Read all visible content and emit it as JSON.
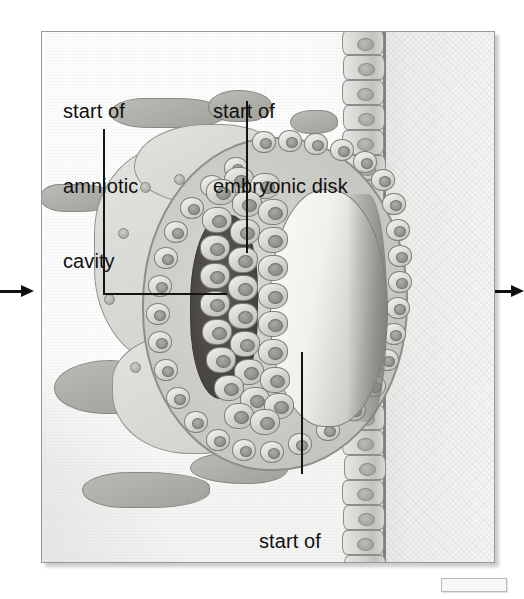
{
  "figure": {
    "background_color": "#ffffff",
    "panel": {
      "background_color": "#ececeb",
      "border_color": "#9a9a98",
      "x": 41,
      "y": 31,
      "width": 452,
      "height": 530
    }
  },
  "labels": [
    {
      "id": "amniotic-cavity",
      "line1": "start of",
      "line2": "amniotic",
      "line3": "cavity",
      "text": "start of amniotic cavity",
      "x": 62,
      "y": 48,
      "leader": {
        "type": "elbow",
        "from_x": 103,
        "from_y": 128,
        "corner_y": 293,
        "to_x": 226
      }
    },
    {
      "id": "embryonic-disk",
      "line1": "start of",
      "line2": "embryonic disk",
      "text": "start of embryonic disk",
      "x": 212,
      "y": 48,
      "leader": {
        "type": "vertical",
        "x": 246,
        "from_y": 100,
        "to_y": 252
      }
    },
    {
      "id": "yolk-sac",
      "line1": "start of",
      "line2": "yolk sac",
      "text": "start of yolk sac",
      "x": 258,
      "y": 478,
      "leader": {
        "type": "vertical",
        "x": 301,
        "from_y": 351,
        "to_y": 473
      }
    }
  ],
  "arrows": [
    {
      "id": "left-arrow",
      "direction": "right",
      "x": 0,
      "y": 285,
      "length": 34
    },
    {
      "id": "right-arrow",
      "direction": "right",
      "x": 495,
      "y": 285,
      "length": 29
    }
  ],
  "structures": [
    {
      "name": "amniotic-cavity",
      "description": "dark cavity, dorsal side of embryonic disk",
      "color": "#4a4743"
    },
    {
      "name": "embryonic-disk",
      "description": "bilaminar disk of columnar cells",
      "color": "#d2d2cc"
    },
    {
      "name": "yolk-sac",
      "description": "light cavity, ventral side of embryonic disk",
      "color": "#f0f0ed"
    },
    {
      "name": "trophoblast",
      "description": "surrounding cell mass with lacunae",
      "color": "#d9d9d4"
    },
    {
      "name": "maternal-lacunae",
      "description": "gray blood-filled spaces in endometrium",
      "color": "#a9a9a3"
    },
    {
      "name": "uterine-epithelium",
      "description": "columnar epithelium column at right",
      "color": "#d2d2ce"
    },
    {
      "name": "uterine-lumen",
      "description": "pale region right of epithelium",
      "color": "#f4f4f2"
    }
  ],
  "scale_box": {
    "id": "scale-bar",
    "x": 441,
    "y": 578,
    "width": 64,
    "height": 12
  }
}
